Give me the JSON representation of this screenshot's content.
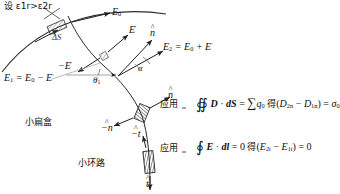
{
  "diagram": {
    "type": "physics-field-boundary-diagram",
    "premise": "设 ε1r>ε2r",
    "premise_parts": {
      "prefix": "设 ",
      "eps": "ε",
      "s1": "1r",
      ",gt": ">",
      "eps2": "ε",
      "s2": "2r"
    },
    "labels": {
      "E0": {
        "text": "E0",
        "base": "E",
        "sub": "0"
      },
      "deltaS": {
        "text": "ΔS"
      },
      "Eprime": {
        "base": "E",
        "sup": "′"
      },
      "minusEprime": {
        "base": "−E",
        "sup": "′"
      },
      "nhat": {
        "base": "n",
        "hat": "^"
      },
      "minus_nhat": {
        "base": "−n",
        "hat": "^"
      },
      "that": {
        "base": "t",
        "hat": "^"
      },
      "minus_that": {
        "base": "−t",
        "hat": "^"
      },
      "alpha": {
        "text": "α"
      },
      "theta1": {
        "base": "θ",
        "sub": "1"
      },
      "E1_eq": {
        "lhs": "E",
        "lhs_sub": "1",
        "eq": " = ",
        "rhs1": "E",
        "rhs1_sub": "0",
        "minus": " − ",
        "rhs2": "E",
        "rhs2_sup": "′"
      },
      "E2_eq": {
        "lhs": "E",
        "lhs_sub": "2",
        "eq": " = ",
        "rhs1": "E",
        "rhs1_sub": "0",
        "plus": " + ",
        "rhs2": "E",
        "rhs2_sup": "′"
      },
      "flat_box": "小扁盒",
      "small_loop": "小环路"
    },
    "equations": [
      {
        "apply": "应用",
        "integral": "∯",
        "body_1": "D",
        "dot": " · ",
        "body_2": "dS",
        "eq1": " = ",
        "sigma_sum": "∑",
        "q0_base": "q",
        "q0_sub": "0",
        "de": "得",
        "open": "(",
        "t1_base": "D",
        "t1_sub": "2n",
        "sep": " − ",
        "t2_base": "D",
        "t2_sub": "1n",
        "close": ")",
        "eq2": " = ",
        "res_base": "σ",
        "res_sub": "0"
      },
      {
        "apply": "应用",
        "integral": "∮",
        "body_1": "E",
        "dot": " · ",
        "body_2": "dl",
        "eq1": " = 0 ",
        "de": "得",
        "open": "(",
        "t1_base": "E",
        "t1_sub": "2t",
        "sep": " − ",
        "t2_base": "E",
        "t2_sub": "1t",
        "close": ")",
        "eq2": " = 0",
        "res_base": "",
        "res_sub": ""
      }
    ],
    "colors": {
      "ink": "#1a1a1a",
      "stroke": "#2b2b2b",
      "light": "#9a9a9a"
    }
  }
}
